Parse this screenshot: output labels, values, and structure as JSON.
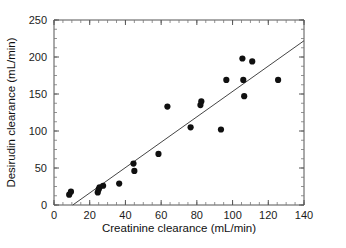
{
  "chart_data": {
    "type": "scatter",
    "title": "",
    "xlabel": "Creatinine clearance (mL/min)",
    "ylabel": "Desirudin clearance (mL/min)",
    "xlim": [
      0,
      140
    ],
    "ylim": [
      0,
      250
    ],
    "xticks": [
      0,
      20,
      40,
      60,
      80,
      100,
      120,
      140
    ],
    "yticks": [
      0,
      50,
      100,
      150,
      200,
      250
    ],
    "xtick_labels": [
      "0",
      "20",
      "40",
      "60",
      "80",
      "100",
      "120",
      "140"
    ],
    "ytick_labels": [
      "0",
      "50",
      "100",
      "150",
      "200",
      "250"
    ],
    "minor_tick_interval_x": 5,
    "minor_tick_interval_y": 12.5,
    "grid": false,
    "legend": "none",
    "frame": "box",
    "marker": "filled-circle",
    "marker_color": "#101010",
    "line_color": "#454545",
    "points": [
      {
        "x": 8.5,
        "y": 14
      },
      {
        "x": 9.5,
        "y": 18
      },
      {
        "x": 24.5,
        "y": 17
      },
      {
        "x": 25.0,
        "y": 21
      },
      {
        "x": 25.5,
        "y": 24
      },
      {
        "x": 27.5,
        "y": 26
      },
      {
        "x": 36.5,
        "y": 29
      },
      {
        "x": 44.5,
        "y": 56
      },
      {
        "x": 45.0,
        "y": 46
      },
      {
        "x": 58.5,
        "y": 69
      },
      {
        "x": 63.5,
        "y": 133
      },
      {
        "x": 76.5,
        "y": 105
      },
      {
        "x": 82.0,
        "y": 135
      },
      {
        "x": 82.5,
        "y": 140
      },
      {
        "x": 93.5,
        "y": 102
      },
      {
        "x": 96.5,
        "y": 169
      },
      {
        "x": 105.5,
        "y": 198
      },
      {
        "x": 106.0,
        "y": 169
      },
      {
        "x": 106.5,
        "y": 147
      },
      {
        "x": 111.0,
        "y": 194
      },
      {
        "x": 125.5,
        "y": 169
      }
    ],
    "fit_line": {
      "name": "regression-line",
      "x_start": 10.5,
      "y_start": 0,
      "x_end": 140,
      "y_end": 222
    }
  }
}
